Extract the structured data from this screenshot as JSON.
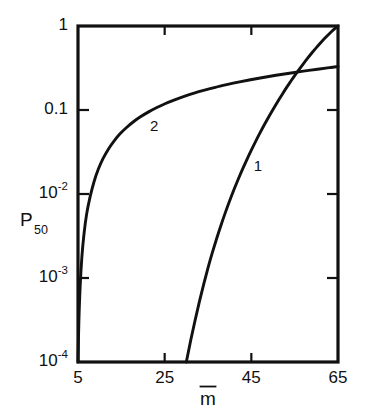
{
  "chart_data": {
    "type": "line",
    "title": "",
    "xlabel": "m̄",
    "ylabel": "P50",
    "ylabel_base": "P",
    "ylabel_sub": "50",
    "xscale": "linear",
    "yscale": "log",
    "xlim": [
      5,
      65
    ],
    "ylim": [
      0.0001,
      1
    ],
    "grid": false,
    "legend": "inline-curve-labels",
    "xticks": [
      5,
      25,
      45,
      65
    ],
    "xtick_labels": [
      "5",
      "25",
      "45",
      "65"
    ],
    "yticks": [
      1,
      0.1,
      0.01,
      0.001,
      0.0001
    ],
    "ytick_labels": [
      "1",
      "0.1",
      "10-2",
      "10-3",
      "10-4"
    ],
    "ytick_label_parts": [
      {
        "base": "1",
        "exp": ""
      },
      {
        "base": "0.1",
        "exp": ""
      },
      {
        "base": "10",
        "exp": "-2"
      },
      {
        "base": "10",
        "exp": "-3"
      },
      {
        "base": "10",
        "exp": "-4"
      }
    ],
    "series": [
      {
        "name": "1",
        "label": "1",
        "label_x": 46.5,
        "label_y": 0.021,
        "points": [
          [
            30.0,
            0.0001
          ],
          [
            31.0,
            0.00018
          ],
          [
            32.0,
            0.00031
          ],
          [
            33.0,
            0.00052
          ],
          [
            34.0,
            0.00084
          ],
          [
            35.0,
            0.00132
          ],
          [
            36.0,
            0.002
          ],
          [
            37.0,
            0.00295
          ],
          [
            38.0,
            0.00425
          ],
          [
            39.0,
            0.006
          ],
          [
            40.0,
            0.0083
          ],
          [
            41.0,
            0.0113
          ],
          [
            42.0,
            0.0151
          ],
          [
            43.0,
            0.0199
          ],
          [
            44.0,
            0.0259
          ],
          [
            45.0,
            0.0333
          ],
          [
            46.0,
            0.0424
          ],
          [
            47.0,
            0.0534
          ],
          [
            48.0,
            0.0667
          ],
          [
            49.0,
            0.0826
          ],
          [
            50.0,
            0.1015
          ],
          [
            51.0,
            0.124
          ],
          [
            52.0,
            0.15
          ],
          [
            53.0,
            0.181
          ],
          [
            54.0,
            0.216
          ],
          [
            55.0,
            0.257
          ],
          [
            56.0,
            0.303
          ],
          [
            57.0,
            0.355
          ],
          [
            58.0,
            0.414
          ],
          [
            59.0,
            0.48
          ],
          [
            60.0,
            0.553
          ],
          [
            61.0,
            0.633
          ],
          [
            62.0,
            0.719
          ],
          [
            63.0,
            0.81
          ],
          [
            64.0,
            0.904
          ],
          [
            65.0,
            1.0
          ]
        ]
      },
      {
        "name": "2",
        "label": "2",
        "label_x": 22.6,
        "label_y": 0.062,
        "points": [
          [
            5.0,
            0.0001
          ],
          [
            5.2,
            0.0003
          ],
          [
            5.5,
            0.0008
          ],
          [
            5.9,
            0.0018
          ],
          [
            6.4,
            0.0034
          ],
          [
            7.0,
            0.0058
          ],
          [
            7.8,
            0.0093
          ],
          [
            8.7,
            0.014
          ],
          [
            9.7,
            0.0198
          ],
          [
            10.8,
            0.0265
          ],
          [
            12.0,
            0.0342
          ],
          [
            13.3,
            0.0427
          ],
          [
            14.7,
            0.052
          ],
          [
            16.2,
            0.0619
          ],
          [
            17.8,
            0.0725
          ],
          [
            19.5,
            0.0835
          ],
          [
            21.3,
            0.095
          ],
          [
            23.2,
            0.107
          ],
          [
            25.2,
            0.1195
          ],
          [
            27.3,
            0.132
          ],
          [
            29.5,
            0.145
          ],
          [
            31.8,
            0.1585
          ],
          [
            34.2,
            0.172
          ],
          [
            36.7,
            0.186
          ],
          [
            39.3,
            0.2
          ],
          [
            42.0,
            0.2145
          ],
          [
            44.8,
            0.229
          ],
          [
            47.7,
            0.244
          ],
          [
            50.7,
            0.259
          ],
          [
            53.8,
            0.274
          ],
          [
            57.0,
            0.29
          ],
          [
            60.3,
            0.306
          ],
          [
            63.0,
            0.319
          ],
          [
            65.0,
            0.329
          ]
        ]
      }
    ]
  },
  "axes": {
    "x_axis_name": "m-bar",
    "y_axis_name": "P50"
  }
}
